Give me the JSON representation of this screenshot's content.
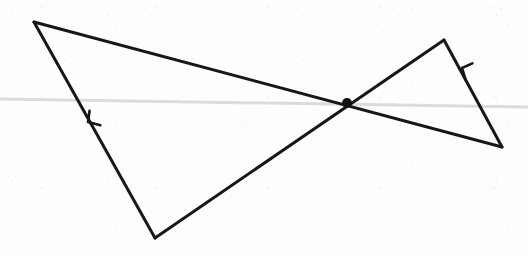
{
  "canvas": {
    "width": 528,
    "height": 256,
    "background_color": "#fdfdfc",
    "description": "Hand-drawn scanned geometric figure: two crossing polylines forming a bowtie-like pair of triangles with a marked intersection point and two direction arrowheads"
  },
  "ink": {
    "stroke_color": "#17171a",
    "stroke_width": 3.0,
    "point_color": "#111114",
    "artifact_color": "#d8d8d6"
  },
  "points": {
    "top_left_vertex": {
      "label": "A",
      "x": 34,
      "y": 22
    },
    "bottom_vertex": {
      "label": "B",
      "x": 155,
      "y": 238
    },
    "intersection_point": {
      "label": "P",
      "x": 347,
      "y": 103,
      "radius": 5,
      "filled": true
    },
    "right_peak_vertex": {
      "label": "C",
      "x": 444,
      "y": 40
    },
    "bottom_right_vertex": {
      "label": "D",
      "x": 502,
      "y": 147
    }
  },
  "segments": [
    {
      "name": "long-diagonal",
      "from": "top_left_vertex",
      "to": "bottom_right_vertex",
      "from_xy": [
        34,
        22
      ],
      "to_xy": [
        502,
        147
      ],
      "passes_through_intersection": true
    },
    {
      "name": "left-descending-edge",
      "from": "top_left_vertex",
      "to": "bottom_vertex",
      "from_xy": [
        34,
        22
      ],
      "to_xy": [
        155,
        238
      ],
      "has_arrowhead": true
    },
    {
      "name": "rising-edge",
      "from": "bottom_vertex",
      "to": "right_peak_vertex",
      "from_xy": [
        155,
        238
      ],
      "to_xy": [
        444,
        40
      ],
      "passes_through_intersection": true
    },
    {
      "name": "right-descending-edge",
      "from": "right_peak_vertex",
      "to": "bottom_right_vertex",
      "from_xy": [
        444,
        40
      ],
      "to_xy": [
        502,
        147
      ],
      "has_arrowhead": true
    }
  ],
  "arrowheads": [
    {
      "name": "left-arrowhead",
      "on_segment": "left-descending-edge",
      "x": 88,
      "y": 122,
      "direction": "up-left",
      "angle_deg": 240,
      "size": 14
    },
    {
      "name": "right-arrowhead",
      "on_segment": "right-descending-edge",
      "x": 462,
      "y": 68,
      "direction": "up-right",
      "angle_deg": 298,
      "size": 14
    }
  ],
  "artifacts": [
    {
      "name": "scanner-streak",
      "type": "horizontal-line",
      "from_xy": [
        0,
        99
      ],
      "to_xy": [
        528,
        107
      ],
      "color": "#d8d8d6",
      "width": 3
    }
  ]
}
